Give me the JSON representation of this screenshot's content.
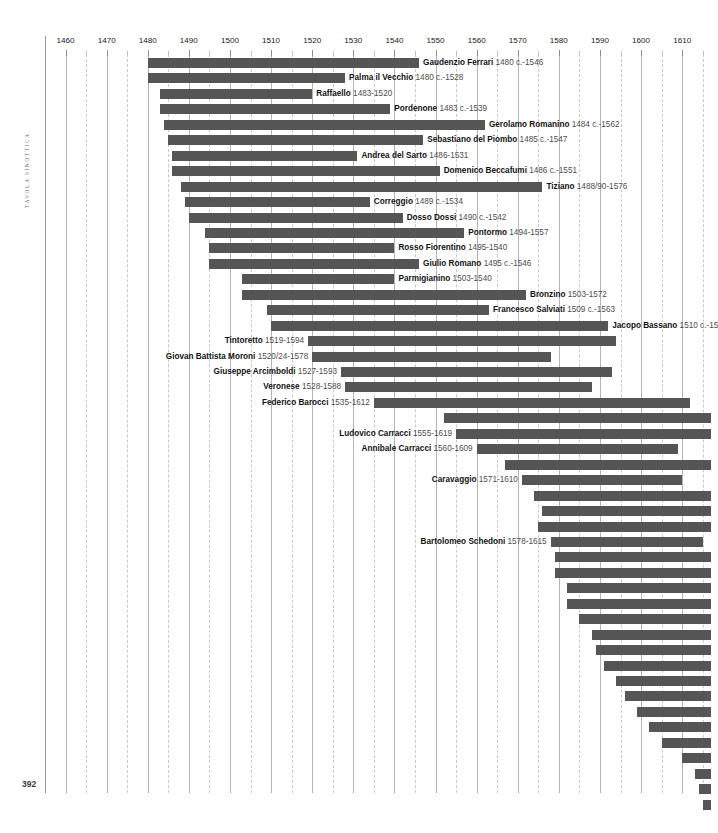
{
  "page": {
    "running_head": "TAVOLA SINOTTICA",
    "folio": "392"
  },
  "chart_data": {
    "type": "bar",
    "title": "Tavola sinottica",
    "orientation": "horizontal",
    "xlabel": "",
    "ylabel": "",
    "grid": true,
    "legend": "none",
    "axis": {
      "min_year": 1455,
      "max_year": 1617,
      "tick_step": 10,
      "minor_tick_step": 5,
      "tick_labels": [
        1460,
        1470,
        1480,
        1490,
        1500,
        1510,
        1520,
        1530,
        1540,
        1550,
        1560,
        1570,
        1580,
        1590,
        1600,
        1610
      ]
    },
    "bar_color": "#555555",
    "note": "Horizontal lifespan bars (Gantt-style) for Italian painters; bar spans birth year to death year.",
    "artists": [
      {
        "name": "Gaudenzio Ferrari",
        "dates": "1480 c.-1546",
        "birth": 1480,
        "death": 1546,
        "label_side": "right"
      },
      {
        "name": "Palma il Vecchio",
        "dates": "1480 c.-1528",
        "birth": 1480,
        "death": 1528,
        "label_side": "right"
      },
      {
        "name": "Raffaello",
        "dates": "1483-1520",
        "birth": 1483,
        "death": 1520,
        "label_side": "right"
      },
      {
        "name": "Pordenone",
        "dates": "1483 c.-1539",
        "birth": 1483,
        "death": 1539,
        "label_side": "right"
      },
      {
        "name": "Gerolamo Romanino",
        "dates": "1484 c.-1562",
        "birth": 1484,
        "death": 1562,
        "label_side": "right"
      },
      {
        "name": "Sebastiano del Piombo",
        "dates": "1485 c.-1547",
        "birth": 1485,
        "death": 1547,
        "label_side": "right"
      },
      {
        "name": "Andrea del Sarto",
        "dates": "1486-1531",
        "birth": 1486,
        "death": 1531,
        "label_side": "right"
      },
      {
        "name": "Domenico Beccafumi",
        "dates": "1486 c.-1551",
        "birth": 1486,
        "death": 1551,
        "label_side": "right"
      },
      {
        "name": "Tiziano",
        "dates": "1488/90-1576",
        "birth": 1488,
        "death": 1576,
        "label_side": "right"
      },
      {
        "name": "Correggio",
        "dates": "1489 c.-1534",
        "birth": 1489,
        "death": 1534,
        "label_side": "right"
      },
      {
        "name": "Dosso Dossi",
        "dates": "1490 c.-1542",
        "birth": 1490,
        "death": 1542,
        "label_side": "right"
      },
      {
        "name": "Pontormo",
        "dates": "1494-1557",
        "birth": 1494,
        "death": 1557,
        "label_side": "right"
      },
      {
        "name": "Rosso Fiorentino",
        "dates": "1495-1540",
        "birth": 1495,
        "death": 1540,
        "label_side": "right"
      },
      {
        "name": "Giulio Romano",
        "dates": "1495 c.-1546",
        "birth": 1495,
        "death": 1546,
        "label_side": "right"
      },
      {
        "name": "Parmigianino",
        "dates": "1503-1540",
        "birth": 1503,
        "death": 1540,
        "label_side": "right"
      },
      {
        "name": "Bronzino",
        "dates": "1503-1572",
        "birth": 1503,
        "death": 1572,
        "label_side": "right"
      },
      {
        "name": "Francesco Salviati",
        "dates": "1509 c.-1563",
        "birth": 1509,
        "death": 1563,
        "label_side": "right"
      },
      {
        "name": "Jacopo Bassano",
        "dates": "1510 c.-15",
        "birth": 1510,
        "death": 1592,
        "label_side": "right"
      },
      {
        "name": "Tintoretto",
        "dates": "1519-1594",
        "birth": 1519,
        "death": 1594,
        "label_side": "left"
      },
      {
        "name": "Giovan Battista Moroni",
        "dates": "1520/24-1578",
        "birth": 1520,
        "death": 1578,
        "label_side": "left"
      },
      {
        "name": "Giuseppe Arcimboldi",
        "dates": "1527-1593",
        "birth": 1527,
        "death": 1593,
        "label_side": "left"
      },
      {
        "name": "Veronese",
        "dates": "1528-1588",
        "birth": 1528,
        "death": 1588,
        "label_side": "left"
      },
      {
        "name": "Federico Barocci",
        "dates": "1535-1612",
        "birth": 1535,
        "death": 1612,
        "label_side": "left"
      },
      {
        "name": "",
        "dates": "",
        "birth": 1552,
        "death": 1617,
        "label_side": "none"
      },
      {
        "name": "Ludovico Carracci",
        "dates": "1555-1619",
        "birth": 1555,
        "death": 1617,
        "label_side": "left"
      },
      {
        "name": "Annibale Carracci",
        "dates": "1560-1609",
        "birth": 1560,
        "death": 1609,
        "label_side": "left"
      },
      {
        "name": "",
        "dates": "",
        "birth": 1567,
        "death": 1617,
        "label_side": "none"
      },
      {
        "name": "Caravaggio",
        "dates": "1571-1610",
        "birth": 1571,
        "death": 1610,
        "label_side": "left"
      },
      {
        "name": "",
        "dates": "",
        "birth": 1574,
        "death": 1617,
        "label_side": "none"
      },
      {
        "name": "",
        "dates": "",
        "birth": 1576,
        "death": 1617,
        "label_side": "none"
      },
      {
        "name": "",
        "dates": "",
        "birth": 1575,
        "death": 1617,
        "label_side": "none"
      },
      {
        "name": "Bartolomeo Schedoni",
        "dates": "1578-1615",
        "birth": 1578,
        "death": 1615,
        "label_side": "left"
      },
      {
        "name": "",
        "dates": "",
        "birth": 1579,
        "death": 1617,
        "label_side": "none"
      },
      {
        "name": "",
        "dates": "",
        "birth": 1579,
        "death": 1617,
        "label_side": "none"
      },
      {
        "name": "",
        "dates": "",
        "birth": 1582,
        "death": 1617,
        "label_side": "none"
      },
      {
        "name": "",
        "dates": "",
        "birth": 1582,
        "death": 1617,
        "label_side": "none"
      },
      {
        "name": "",
        "dates": "",
        "birth": 1585,
        "death": 1617,
        "label_side": "none"
      },
      {
        "name": "",
        "dates": "",
        "birth": 1588,
        "death": 1617,
        "label_side": "none"
      },
      {
        "name": "",
        "dates": "",
        "birth": 1589,
        "death": 1617,
        "label_side": "none"
      },
      {
        "name": "",
        "dates": "",
        "birth": 1591,
        "death": 1617,
        "label_side": "none"
      },
      {
        "name": "",
        "dates": "",
        "birth": 1594,
        "death": 1617,
        "label_side": "none"
      },
      {
        "name": "",
        "dates": "",
        "birth": 1596,
        "death": 1617,
        "label_side": "none"
      },
      {
        "name": "",
        "dates": "",
        "birth": 1599,
        "death": 1617,
        "label_side": "none"
      },
      {
        "name": "",
        "dates": "",
        "birth": 1602,
        "death": 1617,
        "label_side": "none"
      },
      {
        "name": "",
        "dates": "",
        "birth": 1605,
        "death": 1617,
        "label_side": "none"
      },
      {
        "name": "",
        "dates": "",
        "birth": 1610,
        "death": 1617,
        "label_side": "none"
      },
      {
        "name": "",
        "dates": "",
        "birth": 1613,
        "death": 1617,
        "label_side": "none"
      },
      {
        "name": "",
        "dates": "",
        "birth": 1614,
        "death": 1617,
        "label_side": "none"
      },
      {
        "name": "",
        "dates": "",
        "birth": 1615,
        "death": 1617,
        "label_side": "none"
      }
    ]
  }
}
